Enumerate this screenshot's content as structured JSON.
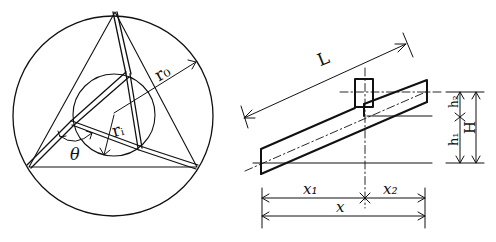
{
  "left_figure": {
    "description": "Tripod truss inscribed in circle",
    "labels": {
      "outer_radius": "r₀",
      "inner_radius": "rᵢ",
      "angle": "θ"
    }
  },
  "right_figure": {
    "description": "Inclined member with joint block, elevation dimensions",
    "labels": {
      "length": "L",
      "h1": "h₁",
      "h2": "h₂",
      "height": "H",
      "x1": "x₁",
      "x2": "x₂",
      "x": "x"
    }
  },
  "colors": {
    "ink": "#111111",
    "background": "#ffffff"
  }
}
